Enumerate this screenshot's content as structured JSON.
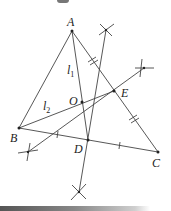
{
  "diagram": {
    "type": "geometry-construction",
    "points": {
      "A": {
        "label": "A",
        "x": 72,
        "y": 31
      },
      "B": {
        "label": "B",
        "x": 19,
        "y": 128
      },
      "C": {
        "label": "C",
        "x": 158,
        "y": 152
      },
      "D": {
        "label": "D",
        "x": 88,
        "y": 140
      },
      "E": {
        "label": "E",
        "x": 114,
        "y": 91
      },
      "O": {
        "label": "O",
        "x": 82,
        "y": 102
      }
    },
    "line_labels": {
      "l1": {
        "main": "l",
        "sub": "1"
      },
      "l2": {
        "main": "l",
        "sub": "2"
      }
    },
    "segments": [
      [
        "A",
        "B"
      ],
      [
        "A",
        "C"
      ],
      [
        "B",
        "C"
      ],
      [
        "A",
        "D"
      ],
      [
        "B",
        "E"
      ],
      [
        "D",
        "E"
      ]
    ],
    "construction_marks": [
      {
        "name": "arc-top",
        "x": 106,
        "y": 30
      },
      {
        "name": "arc-right",
        "x": 144,
        "y": 68
      },
      {
        "name": "arc-lower-left",
        "x": 28,
        "y": 152
      },
      {
        "name": "arc-bottom",
        "x": 79,
        "y": 192
      }
    ],
    "tick_marks": {
      "AE_EC": "double",
      "BD_DC": "single"
    }
  }
}
